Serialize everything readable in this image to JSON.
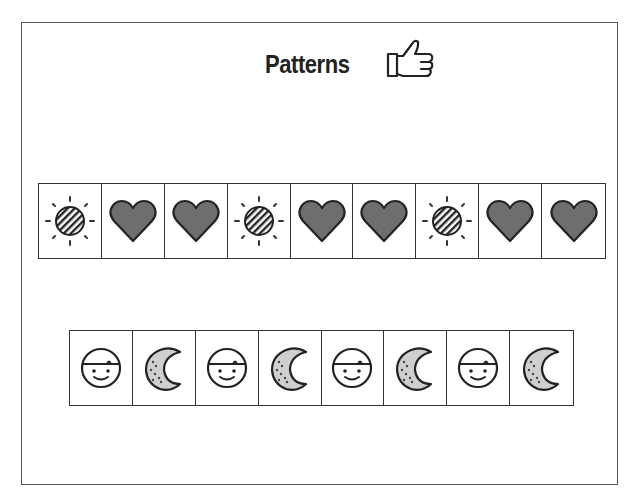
{
  "title": "Patterns",
  "title_icon": "thumbs-up-icon",
  "colors": {
    "heart_fill": "#6e6e6e",
    "moon_fill": "#cfcfcf",
    "outline": "#222222",
    "border": "#555555"
  },
  "pattern_rows": [
    {
      "name": "sun-heart-pattern",
      "cells": [
        "sun-icon",
        "heart-icon",
        "heart-icon",
        "sun-icon",
        "heart-icon",
        "heart-icon",
        "sun-icon",
        "heart-icon",
        "heart-icon"
      ]
    },
    {
      "name": "face-moon-pattern",
      "cells": [
        "face-icon",
        "moon-icon",
        "face-icon",
        "moon-icon",
        "face-icon",
        "moon-icon",
        "face-icon",
        "moon-icon"
      ]
    }
  ]
}
